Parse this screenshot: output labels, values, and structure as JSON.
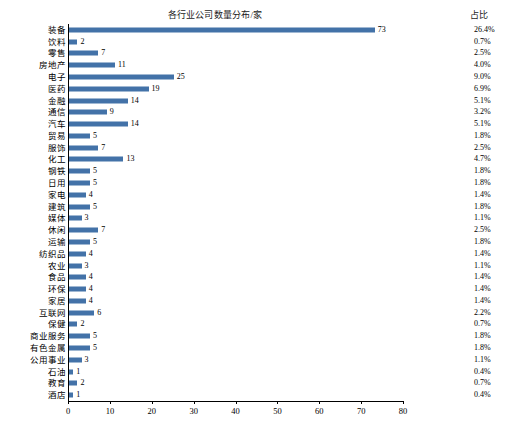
{
  "chart_data": {
    "type": "bar",
    "title": "各行业公司数量分布/家",
    "xlabel": "",
    "ylabel": "",
    "xlim": [
      0,
      80
    ],
    "xticks": [
      0,
      10,
      20,
      30,
      40,
      50,
      60,
      70,
      80
    ],
    "grid": false,
    "orientation": "horizontal",
    "bar_color": "#4372a8",
    "categories": [
      "装备",
      "饮料",
      "零售",
      "房地产",
      "电子",
      "医药",
      "金融",
      "通信",
      "汽车",
      "贸易",
      "服饰",
      "化工",
      "钢铁",
      "日用",
      "家电",
      "建筑",
      "媒体",
      "休闲",
      "运输",
      "纺织品",
      "农业",
      "食品",
      "环保",
      "家居",
      "互联网",
      "保健",
      "商业服务",
      "有色金属",
      "公用事业",
      "石油",
      "教育",
      "酒店"
    ],
    "values": [
      73,
      2,
      7,
      11,
      25,
      19,
      14,
      9,
      14,
      5,
      7,
      13,
      5,
      5,
      4,
      5,
      3,
      7,
      5,
      4,
      3,
      4,
      4,
      4,
      6,
      2,
      5,
      5,
      3,
      1,
      2,
      1
    ],
    "percent_header": "占比",
    "percents": [
      "26.4%",
      "0.7%",
      "2.5%",
      "4.0%",
      "9.0%",
      "6.9%",
      "5.1%",
      "3.2%",
      "5.1%",
      "1.8%",
      "2.5%",
      "4.7%",
      "1.8%",
      "1.8%",
      "1.4%",
      "1.8%",
      "1.1%",
      "2.5%",
      "1.8%",
      "1.4%",
      "1.1%",
      "1.4%",
      "1.4%",
      "1.4%",
      "2.2%",
      "0.7%",
      "1.8%",
      "1.8%",
      "1.1%",
      "0.4%",
      "0.7%",
      "0.4%"
    ]
  },
  "footer": {
    "note": ""
  }
}
